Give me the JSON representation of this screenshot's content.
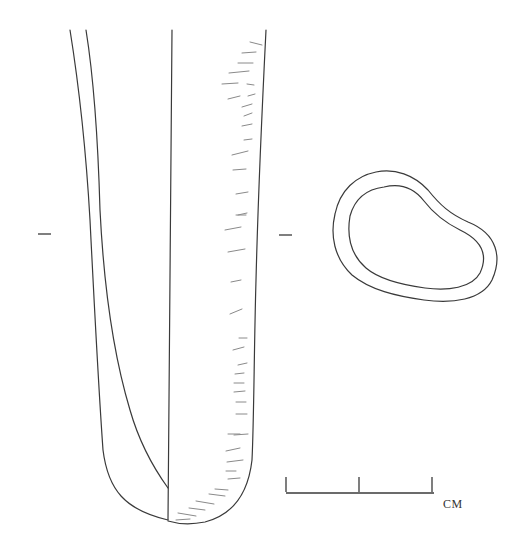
{
  "figure": {
    "type": "archaeological-artifact-drawing",
    "views": [
      {
        "name": "profile-view",
        "description": "side profile of tapered tubular object with cut-away section"
      },
      {
        "name": "cross-section-view",
        "description": "rounded irregular ring cross-section"
      }
    ],
    "section_marks": [
      "left-section-tick",
      "right-section-tick"
    ],
    "scale_bar": {
      "label": "CM",
      "segments": 2
    },
    "colors": {
      "line": "#3a3a3a",
      "hatch": "#8a8a8a",
      "background": "#ffffff"
    }
  }
}
